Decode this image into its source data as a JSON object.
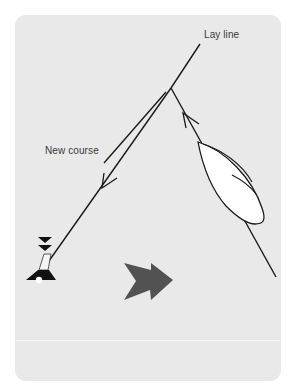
{
  "diagram": {
    "labels": {
      "lay_line": "Lay line",
      "new_course": "New course"
    },
    "elements": {
      "mark": "windward-mark-buoy-icon",
      "boat": "sailboat-hull-icon",
      "wind_arrow": "wind-direction-arrow-icon"
    },
    "colors": {
      "background": "#e9e9e9",
      "line": "#1a1a1a",
      "boat_fill": "#ffffff",
      "arrow_fill": "#505050",
      "mark_fill": "#111111"
    }
  }
}
